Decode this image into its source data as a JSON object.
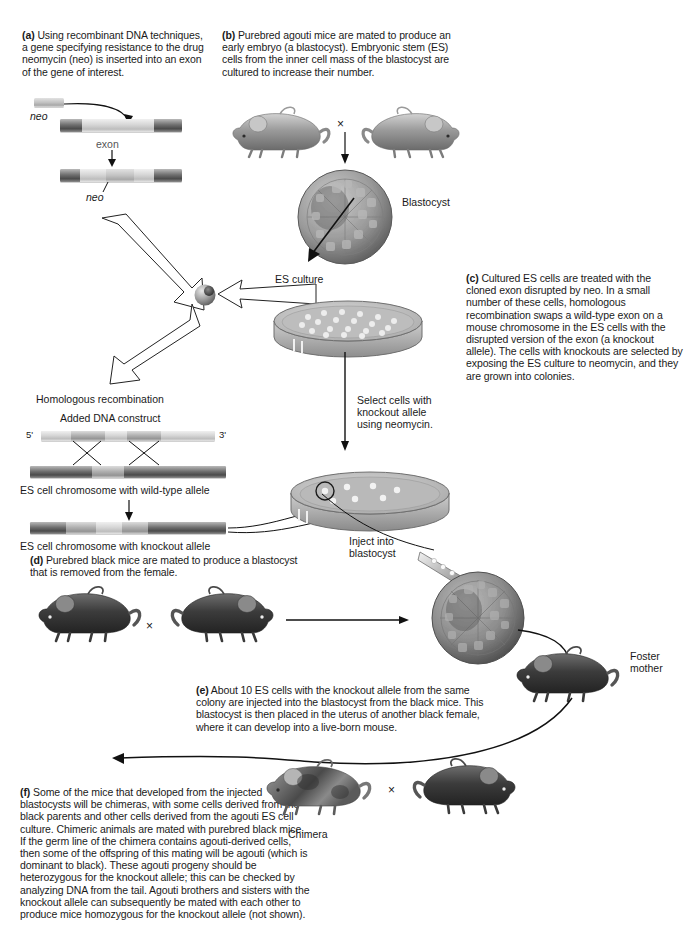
{
  "figure": {
    "panels": {
      "a": {
        "tag": "(a)",
        "text": "Using recombinant DNA techniques, a gene specifying resistance to the drug neomycin (neo) is inserted into an exon of the gene of interest."
      },
      "b": {
        "tag": "(b)",
        "text": "Purebred agouti mice are mated to produce an early embryo (a blastocyst). Embryonic stem (ES) cells from the inner cell mass of the blastocyst are cultured to increase their number."
      },
      "c": {
        "tag": "(c)",
        "text": "Cultured ES cells are treated with the cloned exon disrupted by neo. In a small number of these cells, homologous recombination swaps a wild-type exon on a mouse chromosome in the ES cells with the disrupted version of the exon (a knockout allele). The cells with knockouts are selected by exposing the ES culture to neomycin, and they are grown into colonies."
      },
      "d": {
        "tag": "(d)",
        "text": "Purebred black mice are mated to produce a blastocyst that is removed from the female."
      },
      "e": {
        "tag": "(e)",
        "text": "About 10 ES cells with the knockout allele from the same colony are injected into the blastocyst from the black mice. This blastocyst is then placed in the uterus of another black female, where it can develop into a live-born mouse."
      },
      "f": {
        "tag": "(f)",
        "text": "Some of the mice that developed from the injected blastocysts will be chimeras, with some cells derived from the black parents and other cells derived from the agouti ES cell culture. Chimeric animals are mated with purebred black mice. If the germ line of the chimera contains agouti-derived cells, then some of the offspring of this mating will be agouti (which is dominant to black). These agouti progeny should be heterozygous for the knockout allele; this can be checked by analyzing DNA from the tail. Agouti brothers and sisters with the knockout allele can subsequently be mated with each other to produce mice homozygous for the knockout allele (not shown)."
      }
    },
    "labels": {
      "neo_top": "neo",
      "neo_bottom": "neo",
      "exon": "exon",
      "blastocyst": "Blastocyst",
      "es_culture": "ES culture",
      "homologous_recombination": "Homologous recombination",
      "added_dna_construct": "Added DNA construct",
      "five_prime": "5'",
      "three_prime": "3'",
      "wild_type_chromosome": "ES cell chromosome with wild-type allele",
      "knockout_chromosome": "ES cell chromosome with knockout allele",
      "select_cells_line1": "Select cells with",
      "select_cells_line2": "knockout allele",
      "select_cells_line3": "using neomycin.",
      "inject_line1": "Inject into",
      "inject_line2": "blastocyst",
      "foster_line1": "Foster",
      "foster_line2": "mother",
      "chimera": "Chimera",
      "cross_symbol": "×"
    },
    "colors": {
      "background": "#ffffff",
      "text": "#1a1a1a",
      "dna_dark": "#6f6f6f",
      "dna_light": "#d6d6d6",
      "mouse_agouti": "#9d9d9d",
      "mouse_black": "#3a3a3a",
      "blastocyst": "#8e8e8e",
      "dish": "#b5b5b5"
    }
  }
}
